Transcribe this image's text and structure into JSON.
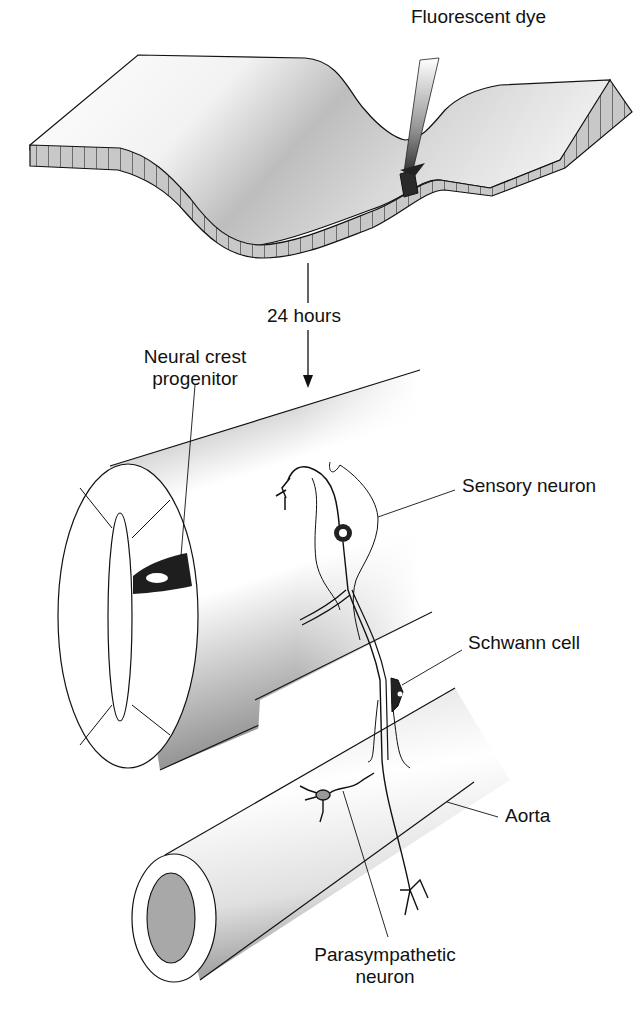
{
  "diagram": {
    "top_panel": {
      "description": "Neural tube epithelium sheet with injection",
      "injection_label": "Fluorescent dye"
    },
    "transition": {
      "time_label": "24 hours"
    },
    "bottom_panel": {
      "progenitor_label_line1": "Neural crest",
      "progenitor_label_line2": "progenitor",
      "sensory_label": "Sensory neuron",
      "schwann_label": "Schwann cell",
      "aorta_label": "Aorta",
      "parasympathetic_label_line1": "Parasympathetic",
      "parasympathetic_label_line2": "neuron"
    },
    "colors": {
      "line": "#111111",
      "cell_fill": "#c8c8c8",
      "dye": "#2a2a2a",
      "shade_dark": "#9a9a9a",
      "background": "#ffffff"
    }
  }
}
